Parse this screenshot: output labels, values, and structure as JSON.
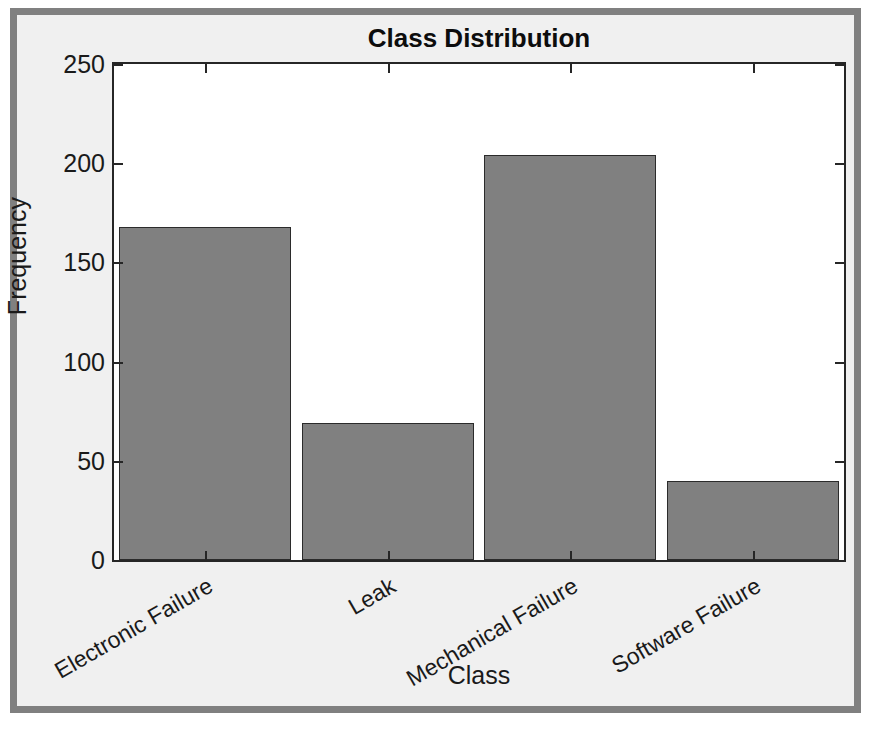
{
  "figure": {
    "window_label": "figure-window",
    "background_color": "#f0f0f0",
    "frame_color": "#808080",
    "axes_background_color": "#ffffff",
    "axes_line_color": "#262626"
  },
  "chart_data": {
    "type": "bar",
    "title": "Class Distribution",
    "xlabel": "Class",
    "ylabel": "Frequency",
    "categories": [
      "Electronic Failure",
      "Leak",
      "Mechanical Failure",
      "Software Failure"
    ],
    "values": [
      168,
      69,
      204,
      40
    ],
    "ylim": [
      0,
      250
    ],
    "yticks": [
      0,
      50,
      100,
      150,
      200,
      250
    ],
    "ytick_labels": [
      "0",
      "50",
      "100",
      "150",
      "200",
      "250"
    ],
    "xtick_labels": [
      "Electronic Failure",
      "Leak",
      "Mechanical Failure",
      "Software Failure"
    ],
    "xtick_rotation_deg": -30,
    "grid": false,
    "legend": null,
    "bar_color": "#808080",
    "bar_edge_color": "#2b2b2b",
    "bar_width_fraction": 0.94
  }
}
